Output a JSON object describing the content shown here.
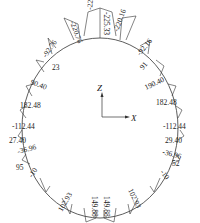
{
  "diagram": {
    "type": "internal-force-diagram-circular-lining",
    "axes": {
      "vertical": "Z",
      "horizontal": "X"
    },
    "colors": {
      "line": "#333333",
      "text": "#222222",
      "background": "#ffffff"
    },
    "labels": [
      {
        "id": "top-left-1",
        "text": "-220.76"
      },
      {
        "id": "top-1",
        "text": "-225.13"
      },
      {
        "id": "top-2",
        "text": "-225.33"
      },
      {
        "id": "top-right-1",
        "text": "-220.16"
      },
      {
        "id": "upper-left-1",
        "text": "-92.76"
      },
      {
        "id": "upper-left-2",
        "text": "23"
      },
      {
        "id": "upper-right-1",
        "text": "-92.16"
      },
      {
        "id": "upper-right-2",
        "text": "91"
      },
      {
        "id": "left-1",
        "text": "90.40"
      },
      {
        "id": "left-2",
        "text": "182.48"
      },
      {
        "id": "right-1",
        "text": "190.40"
      },
      {
        "id": "right-2",
        "text": "182.48"
      },
      {
        "id": "left-3",
        "text": "-112.44"
      },
      {
        "id": "left-4",
        "text": "27.40"
      },
      {
        "id": "left-5",
        "text": "-36.96"
      },
      {
        "id": "left-6",
        "text": "95"
      },
      {
        "id": "left-7",
        "text": "-10"
      },
      {
        "id": "right-3",
        "text": "-112.44"
      },
      {
        "id": "right-4",
        "text": "29.40"
      },
      {
        "id": "right-5",
        "text": "-36.96"
      },
      {
        "id": "right-6",
        "text": "52"
      },
      {
        "id": "right-7",
        "text": "-10"
      },
      {
        "id": "bottom-left-1",
        "text": "102.93"
      },
      {
        "id": "bottom-1",
        "text": "149.88"
      },
      {
        "id": "bottom-2",
        "text": "149.88"
      },
      {
        "id": "bottom-right-1",
        "text": "102.93"
      }
    ]
  }
}
